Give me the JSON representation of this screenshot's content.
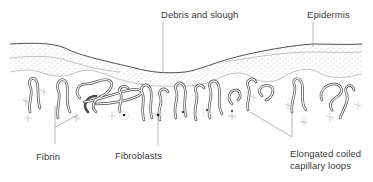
{
  "diagram": {
    "labels": {
      "debris": "Debris and slough",
      "epidermis": "Epidermis",
      "fibrin": "Fibrin",
      "fibroblasts": "Fibroblasts",
      "capillary_line1": "Elongated coiled",
      "capillary_line2": "capillary loops"
    },
    "colors": {
      "line": "#3a3a3a",
      "leader": "#8a8a8a",
      "stipple": "#9a9a9a",
      "background": "#ffffff"
    }
  }
}
